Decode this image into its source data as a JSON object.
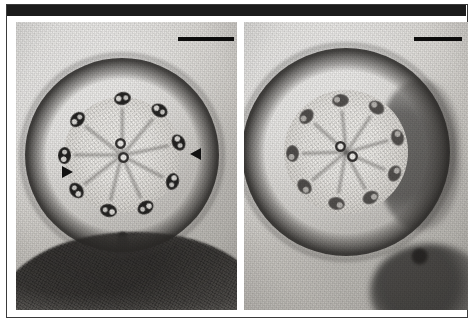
{
  "figure": {
    "kind": "transmission-electron-micrograph",
    "panel_count": 2,
    "header_band_color": "#1b1b1b",
    "frame_color": "#3a3a3a",
    "background_color": "#ffffff",
    "alt": "Two transmission electron micrographs of flagellar axoneme cross sections showing 9+2 microtubule arrangement"
  },
  "panels": [
    {
      "id": "panel-left",
      "label": "",
      "description": "Cross section of a flagellum showing nine outer doublet microtubules and a central pair, attached to the cell surface below",
      "scale_bar": {
        "label": "",
        "x": 162,
        "y": 15,
        "width": 56
      },
      "annotations": [
        {
          "name": "arrowhead-left",
          "label": "",
          "x": 46,
          "y": 144,
          "direction": "right"
        },
        {
          "name": "arrowhead-right",
          "label": "",
          "x": 174,
          "y": 126,
          "direction": "left"
        }
      ],
      "axoneme": {
        "center_x": 106,
        "center_y": 133,
        "outer_radius": 97,
        "doublet_count": 9,
        "central_pair_count": 2
      },
      "doublets": [
        {
          "angle": -90,
          "radius": 57,
          "tilt": -12,
          "tone": "dark"
        },
        {
          "angle": -50,
          "radius": 58,
          "tilt": 28,
          "tone": "dark"
        },
        {
          "angle": -12,
          "radius": 58,
          "tilt": 62,
          "tone": "dark"
        },
        {
          "angle": 28,
          "radius": 57,
          "tilt": 104,
          "tone": "dark"
        },
        {
          "angle": 66,
          "radius": 57,
          "tilt": 148,
          "tone": "dark"
        },
        {
          "angle": 104,
          "radius": 57,
          "tilt": 192,
          "tone": "dark"
        },
        {
          "angle": 142,
          "radius": 58,
          "tilt": 232,
          "tone": "dark"
        },
        {
          "angle": 180,
          "radius": 58,
          "tilt": 272,
          "tone": "dark"
        },
        {
          "angle": -142,
          "radius": 57,
          "tilt": 312,
          "tone": "dark"
        }
      ],
      "central_pair": [
        {
          "dx": -2,
          "dy": -12
        },
        {
          "dx": 1,
          "dy": 2
        }
      ]
    },
    {
      "id": "panel-right",
      "label": "",
      "description": "Cross section of a flagellum with a thicker electron dense membrane sheath, showing nine outer doublets and a central pair",
      "scale_bar": {
        "label": "",
        "x": 170,
        "y": 15,
        "width": 48
      },
      "annotations": [],
      "axoneme": {
        "center_x": 102,
        "center_y": 130,
        "outer_radius": 104,
        "doublet_count": 9,
        "central_pair_count": 2
      },
      "doublets": [
        {
          "angle": -96,
          "radius": 52,
          "tilt": -4,
          "tone": "soft"
        },
        {
          "angle": -56,
          "radius": 54,
          "tilt": 34,
          "tone": "soft"
        },
        {
          "angle": -16,
          "radius": 54,
          "tilt": 74,
          "tone": "soft"
        },
        {
          "angle": 24,
          "radius": 53,
          "tilt": 112,
          "tone": "soft"
        },
        {
          "angle": 62,
          "radius": 52,
          "tilt": 152,
          "tone": "soft"
        },
        {
          "angle": 100,
          "radius": 52,
          "tilt": 190,
          "tone": "soft"
        },
        {
          "angle": 140,
          "radius": 54,
          "tilt": 230,
          "tone": "soft"
        },
        {
          "angle": 178,
          "radius": 54,
          "tilt": 268,
          "tone": "soft"
        },
        {
          "angle": -138,
          "radius": 53,
          "tilt": 308,
          "tone": "soft"
        }
      ],
      "central_pair": [
        {
          "dx": -6,
          "dy": -6
        },
        {
          "dx": 6,
          "dy": 4
        }
      ]
    }
  ]
}
